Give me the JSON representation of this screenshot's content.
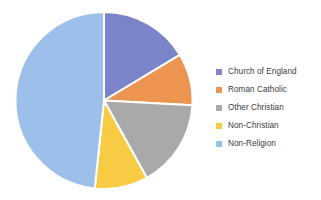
{
  "chart_data": {
    "type": "pie",
    "title": "",
    "subtitle": "",
    "xlabel": "",
    "ylabel": "",
    "legend_position": "right",
    "grid": false,
    "categories": [
      "Church of England",
      "Roman Catholic",
      "Other Christian",
      "Non-Christian",
      "Non-Religion"
    ],
    "values": [
      16.4,
      9.4,
      16.1,
      9.7,
      48.3
    ],
    "slice_start_angles_deg": [
      0,
      59,
      93,
      151,
      186
    ],
    "slice_end_angles_deg": [
      59,
      93,
      151,
      186,
      360
    ],
    "colors": [
      "#7b84c8",
      "#eb9550",
      "#a9a9a9",
      "#f8cb45",
      "#9dc0ea"
    ],
    "series": [
      {
        "name": "Religion",
        "values": [
          16.4,
          9.4,
          16.1,
          9.7,
          48.3
        ]
      }
    ]
  },
  "legend": {
    "items": [
      {
        "label": "Church of England",
        "color": "#7b84c8"
      },
      {
        "label": "Roman Catholic",
        "color": "#eb9550"
      },
      {
        "label": "Other Christian",
        "color": "#a9a9a9"
      },
      {
        "label": "Non-Christian",
        "color": "#f8cb45"
      },
      {
        "label": "Non-Religion",
        "color": "#9dc0ea"
      }
    ]
  },
  "style": {
    "background": "#ffffff",
    "slice_border": "#ffffff",
    "text_color": "#3b3b3b"
  }
}
